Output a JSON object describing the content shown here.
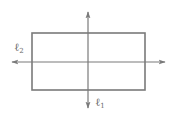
{
  "diagram": {
    "type": "lines-of-symmetry",
    "stroke_color": "#7a7a7a",
    "rectangle": {
      "x": 32,
      "y": 33,
      "width": 113,
      "height": 57
    },
    "lines": [
      {
        "id": "l1",
        "name": "ℓ",
        "subscript": "1",
        "orientation": "vertical",
        "x": 88,
        "y_start": 12,
        "y_end": 108,
        "arrows": "both"
      },
      {
        "id": "l2",
        "name": "ℓ",
        "subscript": "2",
        "orientation": "horizontal",
        "y": 62,
        "x_start": 12,
        "x_end": 165,
        "arrows": "both"
      }
    ]
  }
}
